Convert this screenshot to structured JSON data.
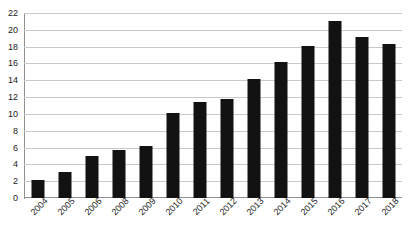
{
  "figure": {
    "clipped_title_ghost": "",
    "background_color": "#ffffff",
    "bar_color": "#121212",
    "gridline_color": "#c9c9cd",
    "axis_color": "#8f8f94",
    "tick_label_color": "#1b1b1b"
  },
  "chart_data": {
    "type": "bar",
    "title": "",
    "xlabel": "",
    "ylabel": "",
    "categories": [
      "2004",
      "2005",
      "2006",
      "2008",
      "2009",
      "2010",
      "2011",
      "2012",
      "2013",
      "2014",
      "2015",
      "2016",
      "2017",
      "2018"
    ],
    "values": [
      2.1,
      3.1,
      5.0,
      5.7,
      6.2,
      10.1,
      11.4,
      11.8,
      14.2,
      16.2,
      18.1,
      21.1,
      19.1,
      18.3
    ],
    "ylim": [
      0,
      22
    ],
    "ytick_step": 2,
    "yticks": [
      0,
      2,
      4,
      6,
      8,
      10,
      12,
      14,
      16,
      18,
      20,
      22
    ],
    "ytick_labels": [
      "0",
      "2",
      "4",
      "6",
      "8",
      "10",
      "12",
      "14",
      "16",
      "18",
      "20",
      "22"
    ],
    "grid": true,
    "grid_axis": "y",
    "legend": false,
    "legend_position": "none",
    "xtick_rotation": -45,
    "bar_color": "#121212"
  }
}
